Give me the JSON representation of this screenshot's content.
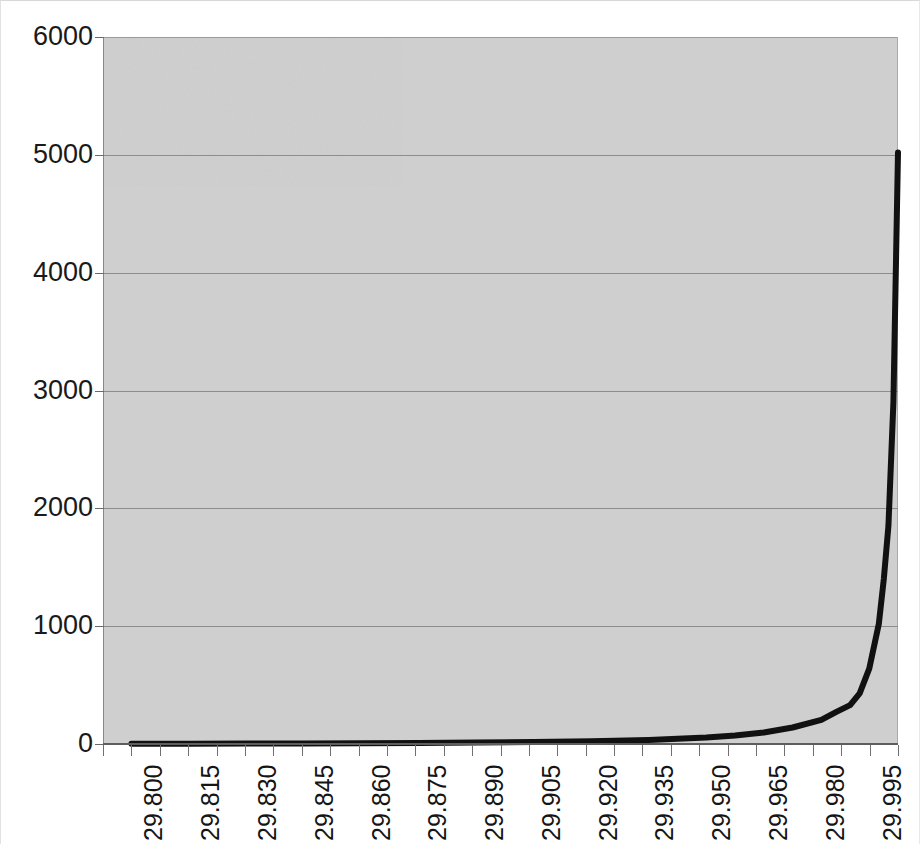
{
  "chart_data": {
    "type": "line",
    "title": "",
    "subtitle": "",
    "xlabel": "",
    "ylabel": "",
    "ylim": [
      0,
      6000
    ],
    "y_ticks": [
      0,
      1000,
      2000,
      3000,
      4000,
      5000,
      6000
    ],
    "y_tick_labels": [
      "0",
      "1000",
      "2000",
      "3000",
      "4000",
      "5000",
      "6000"
    ],
    "x_tick_labels": [
      "29.800",
      "29.815",
      "29.830",
      "29.845",
      "29.860",
      "29.875",
      "29.890",
      "29.905",
      "29.920",
      "29.935",
      "29.950",
      "29.965",
      "29.980",
      "29.995"
    ],
    "x_tick_interval": 0.015,
    "x_minor_ticks_per_label": 2,
    "grid": "horizontal",
    "legend": "none",
    "plot_background_color": "#cfcfcf",
    "line_color": "#111111",
    "line_width_px": 6,
    "series": [
      {
        "name": "series-1",
        "x": [
          29.8,
          29.815,
          29.83,
          29.845,
          29.86,
          29.875,
          29.89,
          29.905,
          29.92,
          29.935,
          29.95,
          29.9575,
          29.965,
          29.9725,
          29.98,
          29.9838,
          29.9875,
          29.99,
          29.9925,
          29.995,
          29.9963,
          29.9975,
          29.9988,
          30.0
        ],
        "y": [
          2,
          3,
          4,
          5,
          7,
          9,
          12,
          17,
          24,
          35,
          55,
          72,
          98,
          140,
          205,
          270,
          330,
          430,
          640,
          1020,
          1400,
          1850,
          2900,
          5020
        ]
      }
    ],
    "annotations": []
  },
  "axis": {
    "y_label_color": "#1a1a1a",
    "x_label_color": "#151515",
    "gridline_color": "#8d8d8d",
    "baseline_color": "#5e5e5e"
  }
}
